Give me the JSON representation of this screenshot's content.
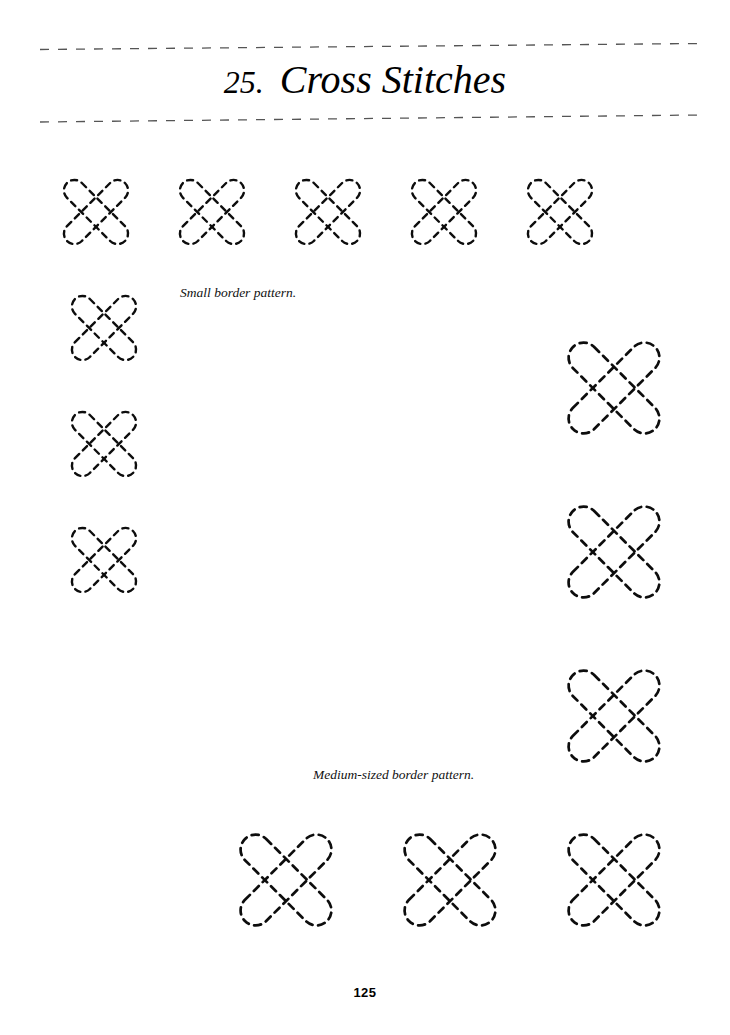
{
  "page": {
    "background_color": "#ffffff",
    "ink_color": "#0d0d0d",
    "width": 730,
    "height": 1035,
    "page_number": "125"
  },
  "heading": {
    "chapter_number": "25.",
    "title": "Cross Stitches",
    "rule_style": "dashed",
    "rule_color": "#555555"
  },
  "captions": {
    "small": "Small border pattern.",
    "medium": "Medium-sized border pattern."
  },
  "artwork": {
    "description": "Dashed-outline cross-stitch border patterns",
    "stroke_color": "#0d0d0d",
    "dash_pattern": "6 5",
    "bands": [
      {
        "name": "top-row-small",
        "orientation": "horizontal",
        "size": "small",
        "cross_count": 5,
        "x_start": 38,
        "x_end": 620,
        "y_center": 212,
        "cross_width": 116,
        "cross_height": 132,
        "bar_width": 21
      },
      {
        "name": "left-column-small",
        "orientation": "vertical",
        "size": "small",
        "cross_count": 4,
        "x_center": 104,
        "y_start": 150,
        "y_end": 622,
        "cross_width": 132,
        "cross_height": 116,
        "bar_width": 21
      },
      {
        "name": "right-column-medium",
        "orientation": "vertical",
        "size": "medium",
        "cross_count": 3,
        "x_center": 614,
        "y_start": 302,
        "y_end": 830,
        "cross_width": 176,
        "cross_height": 168,
        "bar_width": 30
      },
      {
        "name": "bottom-row-medium",
        "orientation": "horizontal",
        "size": "medium",
        "cross_count": 3,
        "x_start": 205,
        "x_end": 712,
        "y_center": 888,
        "cross_width": 168,
        "cross_height": 176,
        "bar_width": 30
      }
    ]
  }
}
